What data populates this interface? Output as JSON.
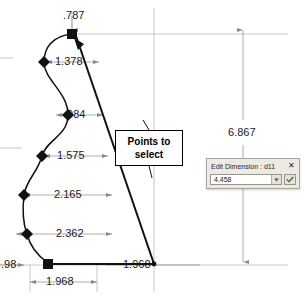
{
  "sketch": {
    "dimensions": [
      {
        "label": ".787",
        "value": 0.787,
        "orientation": "vertical",
        "name": "top-offset"
      },
      {
        "label": "1.378",
        "value": 1.378,
        "orientation": "horizontal",
        "name": "spline-point-1-offset"
      },
      {
        "label": ".984",
        "value": 0.984,
        "orientation": "horizontal",
        "name": "spline-point-2-offset"
      },
      {
        "label": "1.575",
        "value": 1.575,
        "orientation": "horizontal",
        "name": "spline-point-3-offset"
      },
      {
        "label": "2.165",
        "value": 2.165,
        "orientation": "horizontal",
        "name": "spline-point-4-offset"
      },
      {
        "label": "2.362",
        "value": 2.362,
        "orientation": "horizontal",
        "name": "spline-point-5-offset"
      },
      {
        "label": ".98",
        "value": 0.98,
        "orientation": "horizontal",
        "name": "bottom-left-offset"
      },
      {
        "label": "1.968",
        "value": 1.968,
        "orientation": "horizontal",
        "name": "baseline-length"
      },
      {
        "label": "1.968",
        "value": 1.968,
        "orientation": "horizontal",
        "name": "lower-baseline-length"
      },
      {
        "label": "6.867",
        "value": 6.867,
        "orientation": "vertical",
        "name": "overall-height"
      }
    ],
    "callout": {
      "line1": "Points to",
      "line2": "select"
    },
    "control_points": [
      {
        "name": "selected-point-top",
        "type": "square",
        "selected": true
      },
      {
        "name": "control-point-1378",
        "type": "diamond",
        "selected": false
      },
      {
        "name": "control-point-0984",
        "type": "diamond",
        "selected": false
      },
      {
        "name": "control-point-1575",
        "type": "diamond",
        "selected": false
      },
      {
        "name": "control-point-2165",
        "type": "diamond",
        "selected": false
      },
      {
        "name": "control-point-2362",
        "type": "diamond",
        "selected": false
      },
      {
        "name": "selected-point-bottom-left",
        "type": "square",
        "selected": true
      },
      {
        "name": "origin-point",
        "type": "dot",
        "selected": false
      }
    ],
    "colors": {
      "geometry": "#111111",
      "dimension": "#8a8a8a",
      "extension": "#b0b0b0",
      "background": "#ffffff"
    }
  },
  "dialog": {
    "title": "Edit Dimension : d11",
    "close_label": "✕",
    "value": "4.458",
    "dropdown_icon": "chevron-down-icon",
    "accept_icon": "checkmark-icon"
  }
}
